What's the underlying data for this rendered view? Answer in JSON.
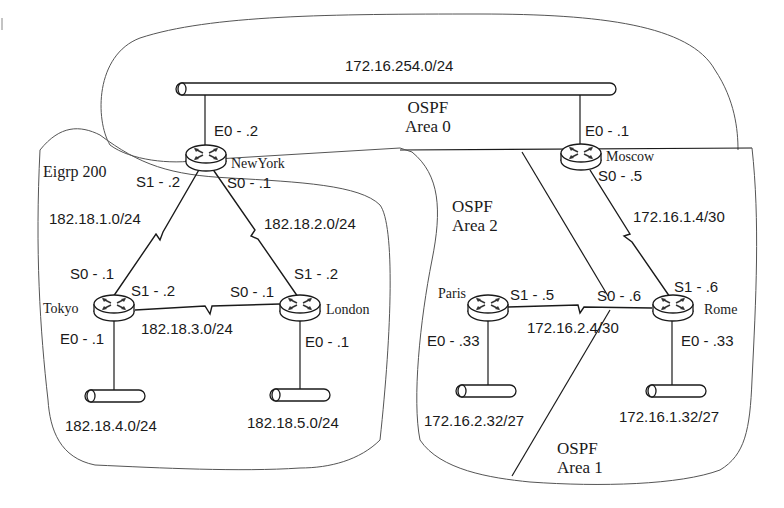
{
  "diagram": {
    "type": "network-topology",
    "colors": {
      "line": "#1a1a1a",
      "boundary": "#555555",
      "background": "#ffffff"
    }
  },
  "areas": {
    "area0": {
      "protocol": "OSPF",
      "name": "Area 0"
    },
    "area1": {
      "protocol": "OSPF",
      "name": "Area 1"
    },
    "area2": {
      "protocol": "OSPF",
      "name": "Area 2"
    },
    "eigrp": {
      "name": "Eigrp 200"
    }
  },
  "networks": {
    "backbone": "172.16.254.0/24",
    "ny_tokyo": "182.18.1.0/24",
    "ny_london": "182.18.2.0/24",
    "tokyo_london": "182.18.3.0/24",
    "tokyo_lan": "182.18.4.0/24",
    "london_lan": "182.18.5.0/24",
    "moscow_rome": "172.16.1.4/30",
    "paris_rome": "172.16.2.4/30",
    "paris_lan": "172.16.2.32/27",
    "rome_lan": "172.16.1.32/27"
  },
  "routers": {
    "newyork": {
      "name": "NewYork",
      "e0": "E0 - .2",
      "s1": "S1 - .2",
      "s0": "S0 - .1"
    },
    "moscow": {
      "name": "Moscow",
      "e0": "E0 - .1",
      "s0": "S0 - .5"
    },
    "tokyo": {
      "name": "Tokyo",
      "s0": "S0 - .1",
      "s1": "S1 - .2",
      "e0": "E0 - .1"
    },
    "london": {
      "name": "London",
      "s1": "S1 - .2",
      "s0": "S0 - .1",
      "e0": "E0 - .1"
    },
    "paris": {
      "name": "Paris",
      "s1": "S1 - .5",
      "e0": "E0 - .33"
    },
    "rome": {
      "name": "Rome",
      "s1": "S1 - .6",
      "s0": "S0 - .6",
      "e0": "E0 - .33"
    }
  }
}
